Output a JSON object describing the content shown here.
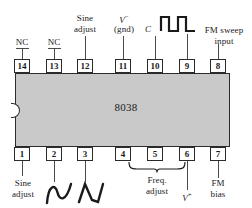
{
  "diagram": {
    "chip": {
      "part_number": "8038",
      "package": "14-pin DIP",
      "body_color": "#c9c9c9",
      "outline_color": "#2b2b2b"
    },
    "pins_top": [
      {
        "number": "14",
        "label": "NC",
        "label_lines": [
          "NC"
        ]
      },
      {
        "number": "13",
        "label": "NC",
        "label_lines": [
          "NC"
        ]
      },
      {
        "number": "12",
        "label": "Sine adjust",
        "label_lines": [
          "Sine",
          "adjust"
        ]
      },
      {
        "number": "11",
        "label": "V- (gnd)",
        "label_lines": [
          "V−",
          "(gnd)"
        ]
      },
      {
        "number": "10",
        "label": "C",
        "label_lines": [
          "C"
        ]
      },
      {
        "number": "9",
        "label": "square wave output",
        "label_lines": [
          ""
        ]
      },
      {
        "number": "8",
        "label": "FM sweep input",
        "label_lines": [
          "FM sweep",
          "input"
        ]
      }
    ],
    "pins_bottom": [
      {
        "number": "1",
        "label": "Sine adjust",
        "label_lines": [
          "Sine",
          "adjust"
        ]
      },
      {
        "number": "2",
        "label": "sine wave output",
        "label_lines": [
          ""
        ]
      },
      {
        "number": "3",
        "label": "triangle wave output",
        "label_lines": [
          ""
        ]
      },
      {
        "number": "4",
        "label": "Freq. adjust",
        "label_lines": [
          "Freq.",
          "adjust"
        ]
      },
      {
        "number": "5",
        "label": "Freq. adjust",
        "label_lines": [
          "Freq.",
          "adjust"
        ]
      },
      {
        "number": "6",
        "label": "V+",
        "label_lines": [
          "V+"
        ]
      },
      {
        "number": "7",
        "label": "FM bias",
        "label_lines": [
          "FM",
          "bias"
        ]
      }
    ],
    "labels": {
      "nc_14": "NC",
      "nc_13": "NC",
      "sine_adjust_top_l1": "Sine",
      "sine_adjust_top_l2": "adjust",
      "v_minus_letter": "V",
      "v_minus_sign": "−",
      "v_minus_gnd": "(gnd)",
      "cap_c": "C",
      "fm_sweep_l1": "FM sweep",
      "fm_sweep_l2": "input",
      "sine_adjust_bot_l1": "Sine",
      "sine_adjust_bot_l2": "adjust",
      "freq_adjust_l1": "Freq.",
      "freq_adjust_l2": "adjust",
      "v_plus_letter": "V",
      "v_plus_sign": "+",
      "fm_bias_l1": "FM",
      "fm_bias_l2": "bias",
      "chip_part": "8038"
    },
    "icons": {
      "square_wave": "square-wave-icon",
      "sine_wave": "sine-wave-icon",
      "triangle_wave": "triangle-wave-icon",
      "brace": "curly-brace-icon",
      "notch": "dip-notch-icon"
    }
  }
}
